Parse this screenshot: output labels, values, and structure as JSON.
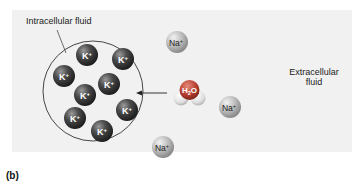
{
  "figure": {
    "panel_label": "(b)",
    "labels": {
      "intracellular": "Intracellular fluid",
      "extracellular_line1": "Extracellular",
      "extracellular_line2": "fluid"
    },
    "ions": {
      "potassium": {
        "symbol": "K",
        "charge": "+",
        "count": 8,
        "color": "#3a3a3a"
      },
      "sodium": {
        "symbol": "Na",
        "charge": "+",
        "count": 3,
        "color": "#b8b8b8"
      }
    },
    "water": {
      "formula_main": "H",
      "formula_sub": "2",
      "formula_end": "O"
    },
    "colors": {
      "panel_bg": "#f1f1f1",
      "cell_border": "#333333",
      "oxygen": "#c24a3c",
      "hydrogen": "#e6e6e6"
    }
  }
}
